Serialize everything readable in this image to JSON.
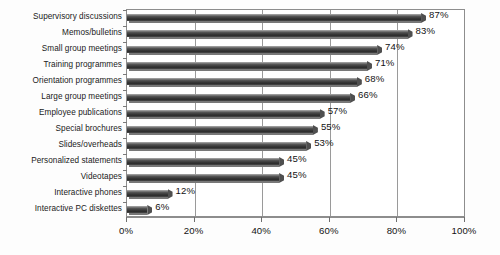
{
  "chart_data": {
    "type": "bar",
    "orientation": "horizontal",
    "title": "",
    "subtitle": "",
    "xlabel": "",
    "ylabel": "",
    "xlim": [
      0,
      100
    ],
    "grid": true,
    "legend": false,
    "value_suffix": "%",
    "xticks": [
      "0%",
      "20%",
      "40%",
      "60%",
      "80%",
      "100%"
    ],
    "xtick_values": [
      0,
      20,
      40,
      60,
      80,
      100
    ],
    "categories": [
      "Supervisory discussions",
      "Memos/bulletins",
      "Small group meetings",
      "Training programmes",
      "Orientation programmes",
      "Large group meetings",
      "Employee publications",
      "Special brochures",
      "Slides/overheads",
      "Personalized statements",
      "Videotapes",
      "Interactive phones",
      "Interactive PC diskettes"
    ],
    "values": [
      87,
      83,
      74,
      71,
      68,
      66,
      57,
      55,
      53,
      45,
      45,
      12,
      6
    ],
    "data_labels": [
      "87%",
      "83%",
      "74%",
      "71%",
      "68%",
      "66%",
      "57%",
      "55%",
      "53%",
      "45%",
      "45%",
      "12%",
      "6%"
    ],
    "colors": {
      "bar": "#3d3d3d",
      "bar_highlight": "#8a8a8a",
      "bar_shadow": "#787878",
      "plot_background": "#ffffff",
      "page_background": "#fdfdfd",
      "axis": "#8d8d8d",
      "gridline": "#9a9a9a",
      "text": "#121212"
    }
  }
}
